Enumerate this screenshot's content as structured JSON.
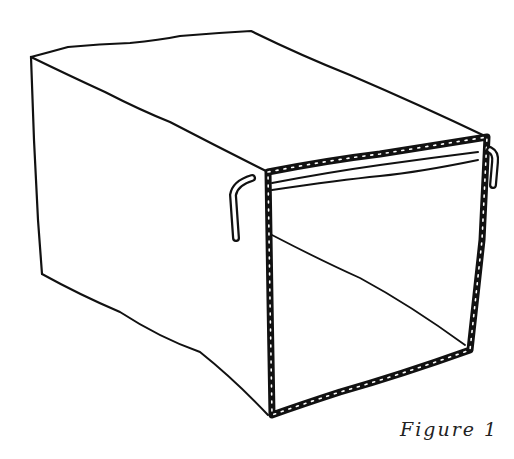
{
  "figure": {
    "caption": "Figure 1",
    "colors": {
      "ink": "#111111",
      "background": "#ffffff"
    }
  }
}
